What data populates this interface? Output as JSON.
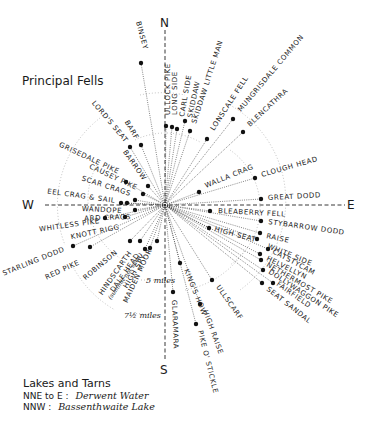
{
  "title": "Principal Fells",
  "center": {
    "x": 165,
    "y": 205
  },
  "compass": {
    "N": "N",
    "S": "S",
    "E": "E",
    "W": "W"
  },
  "rings": [
    {
      "label": "5 miles",
      "radius": 70
    },
    {
      "label": "7½ miles",
      "radius": 105
    }
  ],
  "fells": [
    {
      "name": "BINSEY",
      "x": 141,
      "y": 63,
      "lx": 136,
      "ly": 22,
      "rot": 75,
      "anchor": "start"
    },
    {
      "name": "ULLOCK PIKE",
      "x": 166,
      "y": 126,
      "lx": 170,
      "ly": 115,
      "rot": -90,
      "anchor": "start"
    },
    {
      "name": "LONG SIDE",
      "x": 172,
      "y": 127,
      "lx": 177,
      "ly": 115,
      "rot": -90,
      "anchor": "start"
    },
    {
      "name": "CARL SIDE",
      "x": 177,
      "y": 129,
      "lx": 184,
      "ly": 117,
      "rot": -80,
      "anchor": "start"
    },
    {
      "name": "SKIDDAW",
      "x": 185,
      "y": 121,
      "lx": 192,
      "ly": 118,
      "rot": -78,
      "anchor": "start"
    },
    {
      "name": "SKIDDAW LITTLE MAN",
      "x": 190,
      "y": 131,
      "lx": 196,
      "ly": 124,
      "rot": -72,
      "anchor": "start"
    },
    {
      "name": "LONSCALE FELL",
      "x": 207,
      "y": 139,
      "lx": 214,
      "ly": 131,
      "rot": -57,
      "anchor": "start"
    },
    {
      "name": "MUNGRISDALE COMMON",
      "x": 233,
      "y": 119,
      "lx": 241,
      "ly": 112,
      "rot": -50,
      "anchor": "start"
    },
    {
      "name": "BLENCATHRA",
      "x": 243,
      "y": 132,
      "lx": 250,
      "ly": 127,
      "rot": -43,
      "anchor": "start"
    },
    {
      "name": "WALLA CRAG",
      "x": 199,
      "y": 192,
      "lx": 206,
      "ly": 188,
      "rot": -22,
      "anchor": "start"
    },
    {
      "name": "CLOUGH HEAD",
      "x": 255,
      "y": 178,
      "lx": 262,
      "ly": 177,
      "rot": -16,
      "anchor": "start"
    },
    {
      "name": "GREAT DODD",
      "x": 261,
      "y": 199,
      "lx": 268,
      "ly": 200,
      "rot": -3,
      "anchor": "start"
    },
    {
      "name": "BLEABERRY FELL",
      "x": 210,
      "y": 211,
      "lx": 218,
      "ly": 213,
      "rot": 3,
      "anchor": "start"
    },
    {
      "name": "STYBARROW DODD",
      "x": 261,
      "y": 221,
      "lx": 268,
      "ly": 224,
      "rot": 8,
      "anchor": "start"
    },
    {
      "name": "HIGH SEAT",
      "x": 209,
      "y": 228,
      "lx": 214,
      "ly": 231,
      "rot": 15,
      "anchor": "start"
    },
    {
      "name": "RAISE",
      "x": 260,
      "y": 233,
      "lx": 266,
      "ly": 238,
      "rot": 12,
      "anchor": "start"
    },
    {
      "name": "WHITE SIDE",
      "x": 257,
      "y": 239,
      "lx": 267,
      "ly": 248,
      "rot": 22,
      "anchor": "start"
    },
    {
      "name": "CATSTYCAM",
      "x": 268,
      "y": 249,
      "lx": 272,
      "ly": 253,
      "rot": 28,
      "anchor": "start"
    },
    {
      "name": "HELVELLYN",
      "x": 260,
      "y": 254,
      "lx": 266,
      "ly": 260,
      "rot": 26,
      "anchor": "start"
    },
    {
      "name": "NETHERMOST PIKE",
      "x": 261,
      "y": 260,
      "lx": 266,
      "ly": 266,
      "rot": 30,
      "anchor": "start"
    },
    {
      "name": "DOLLYWAGGON PIKE",
      "x": 263,
      "y": 270,
      "lx": 268,
      "ly": 273,
      "rot": 33,
      "anchor": "start"
    },
    {
      "name": "FAIRFIELD",
      "x": 273,
      "y": 283,
      "lx": 276,
      "ly": 285,
      "rot": 35,
      "anchor": "start"
    },
    {
      "name": "SEAT SANDAL",
      "x": 262,
      "y": 283,
      "lx": 266,
      "ly": 290,
      "rot": 38,
      "anchor": "start"
    },
    {
      "name": "KING'S HOW",
      "x": 180,
      "y": 263,
      "lx": 184,
      "ly": 270,
      "rot": 68,
      "anchor": "start"
    },
    {
      "name": "ULLSCARF",
      "x": 212,
      "y": 280,
      "lx": 216,
      "ly": 287,
      "rot": 55,
      "anchor": "start"
    },
    {
      "name": "HIGH RAISE",
      "x": 200,
      "y": 304,
      "lx": 203,
      "ly": 311,
      "rot": 70,
      "anchor": "start"
    },
    {
      "name": "PIKE O' STICKLE",
      "x": 196,
      "y": 324,
      "lx": 198,
      "ly": 331,
      "rot": 76,
      "anchor": "start"
    },
    {
      "name": "GLARAMARA",
      "x": 173,
      "y": 292,
      "lx": 172,
      "ly": 300,
      "rot": 88,
      "anchor": "start"
    },
    {
      "name": "BARF",
      "x": 141,
      "y": 145,
      "lx": 135,
      "ly": 140,
      "rot": 60,
      "anchor": "end"
    },
    {
      "name": "LORD'S SEAT",
      "x": 130,
      "y": 147,
      "lx": 125,
      "ly": 143,
      "rot": 50,
      "anchor": "end"
    },
    {
      "name": "BARROW",
      "x": 148,
      "y": 186,
      "lx": 143,
      "ly": 181,
      "rot": 55,
      "anchor": "end"
    },
    {
      "name": "GRISEDALE PIKE",
      "x": 126,
      "y": 182,
      "lx": 118,
      "ly": 174,
      "rot": 25,
      "anchor": "end"
    },
    {
      "name": "CAUSEY PIKE",
      "x": 143,
      "y": 194,
      "lx": 136,
      "ly": 190,
      "rot": 25,
      "anchor": "end"
    },
    {
      "name": "SCAR CRAGS",
      "x": 135,
      "y": 200,
      "lx": 130,
      "ly": 196,
      "rot": 18,
      "anchor": "end"
    },
    {
      "name": "EEL CRAG & SAIL",
      "x": 121,
      "y": 203,
      "lx": 115,
      "ly": 203,
      "rot": 8,
      "anchor": "end"
    },
    {
      "name": "WANDOPE",
      "x": 127,
      "y": 203,
      "lx": 122,
      "ly": 213,
      "rot": 3,
      "anchor": "end"
    },
    {
      "name": "ARD CRAGS",
      "x": 135,
      "y": 210,
      "lx": 131,
      "ly": 219,
      "rot": -2,
      "anchor": "end"
    },
    {
      "name": "WHITLESS PIKE",
      "x": 105,
      "y": 218,
      "lx": 100,
      "ly": 223,
      "rot": -8,
      "anchor": "end"
    },
    {
      "name": "KNOTT RIGG",
      "x": 125,
      "y": 217,
      "lx": 120,
      "ly": 229,
      "rot": -12,
      "anchor": "end"
    },
    {
      "name": "STARLING DODD",
      "x": 73,
      "y": 246,
      "lx": 65,
      "ly": 251,
      "rot": -22,
      "anchor": "end"
    },
    {
      "name": "RED PIKE",
      "x": 90,
      "y": 247,
      "lx": 80,
      "ly": 264,
      "rot": -25,
      "anchor": "end"
    },
    {
      "name": "ROBINSON",
      "x": 130,
      "y": 241,
      "lx": 118,
      "ly": 253,
      "rot": -40,
      "anchor": "end"
    },
    {
      "name": "HINDSCARTH",
      "x": 140,
      "y": 241,
      "lx": 132,
      "ly": 253,
      "rot": -55,
      "anchor": "end"
    },
    {
      "name": "DALE HEAD",
      "x": 145,
      "y": 249,
      "lx": 140,
      "ly": 255,
      "rot": -55,
      "anchor": "end"
    },
    {
      "name": "HIGH SPY",
      "x": 150,
      "y": 248,
      "lx": 146,
      "ly": 256,
      "rot": -60,
      "anchor": "end"
    },
    {
      "name": "MAIDEN MOOR",
      "x": 157,
      "y": 241,
      "lx": 152,
      "ly": 250,
      "rot": -65,
      "anchor": "end"
    }
  ],
  "annotations": {
    "summit_note": "(summit not seen)",
    "high_spy_label": "HIGH SPY",
    "maiden_label": "MAIDEN",
    "moor_label": "MOOR"
  },
  "legend": {
    "title": "Lakes and Tarns",
    "lines": [
      {
        "direction": "NNE to E :",
        "name": "Derwent Water"
      },
      {
        "direction": "NNW :",
        "name": "Bassenthwaite Lake"
      }
    ]
  }
}
